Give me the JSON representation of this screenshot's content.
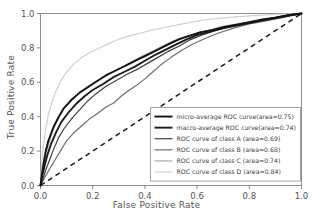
{
  "chart_data": {
    "type": "line",
    "title": "",
    "xlabel": "False Positive Rate",
    "ylabel": "True Positive Rate",
    "xlim": [
      0.0,
      1.0
    ],
    "ylim": [
      0.0,
      1.0
    ],
    "xticks": [
      "0.0",
      "0.2",
      "0.4",
      "0.6",
      "0.8",
      "1.0"
    ],
    "yticks": [
      "0.0",
      "0.2",
      "0.4",
      "0.6",
      "0.8",
      "1.0"
    ],
    "xtick_values": [
      0.0,
      0.2,
      0.4,
      0.6,
      0.8,
      1.0
    ],
    "ytick_values": [
      0.0,
      0.2,
      0.4,
      0.6,
      0.8,
      1.0
    ],
    "grid": false,
    "legend_position": "lower right",
    "chance_line": {
      "label": "chance",
      "style": "dashed",
      "color": "#1a1a1a",
      "x": [
        0.0,
        1.0
      ],
      "y": [
        0.0,
        1.0
      ]
    },
    "series": [
      {
        "name": "micro-average ROC curve(area=0.75)",
        "area": 0.75,
        "color": "#121212",
        "width": 1.9,
        "x": [
          0.0,
          0.005,
          0.012,
          0.02,
          0.03,
          0.05,
          0.07,
          0.09,
          0.12,
          0.15,
          0.18,
          0.21,
          0.25,
          0.29,
          0.33,
          0.37,
          0.41,
          0.45,
          0.49,
          0.53,
          0.57,
          0.61,
          0.66,
          0.7,
          0.75,
          0.8,
          0.85,
          0.9,
          0.95,
          1.0
        ],
        "y": [
          0.0,
          0.06,
          0.13,
          0.2,
          0.26,
          0.34,
          0.4,
          0.45,
          0.5,
          0.54,
          0.57,
          0.6,
          0.64,
          0.67,
          0.7,
          0.73,
          0.76,
          0.79,
          0.82,
          0.85,
          0.87,
          0.89,
          0.905,
          0.92,
          0.935,
          0.95,
          0.965,
          0.975,
          0.99,
          1.0
        ]
      },
      {
        "name": "macro-average ROC curve(area=0.74)",
        "area": 0.74,
        "color": "#1c1c1c",
        "width": 1.9,
        "x": [
          0.0,
          0.006,
          0.015,
          0.025,
          0.04,
          0.06,
          0.08,
          0.11,
          0.14,
          0.17,
          0.2,
          0.24,
          0.28,
          0.32,
          0.36,
          0.4,
          0.44,
          0.48,
          0.52,
          0.56,
          0.6,
          0.65,
          0.7,
          0.75,
          0.8,
          0.85,
          0.9,
          0.95,
          1.0
        ],
        "y": [
          0.0,
          0.05,
          0.11,
          0.17,
          0.24,
          0.31,
          0.37,
          0.43,
          0.48,
          0.52,
          0.555,
          0.59,
          0.63,
          0.66,
          0.69,
          0.725,
          0.76,
          0.79,
          0.82,
          0.85,
          0.875,
          0.895,
          0.915,
          0.93,
          0.945,
          0.96,
          0.975,
          0.99,
          1.0
        ]
      },
      {
        "name": "ROC curve of class A (area=0.69)",
        "area": 0.69,
        "color": "#3f3f3f",
        "width": 1.2,
        "x": [
          0.0,
          0.01,
          0.02,
          0.035,
          0.05,
          0.07,
          0.09,
          0.12,
          0.15,
          0.18,
          0.21,
          0.25,
          0.29,
          0.33,
          0.37,
          0.41,
          0.45,
          0.49,
          0.53,
          0.57,
          0.62,
          0.67,
          0.72,
          0.78,
          0.84,
          0.9,
          0.95,
          1.0
        ],
        "y": [
          0.0,
          0.04,
          0.09,
          0.15,
          0.21,
          0.28,
          0.33,
          0.39,
          0.44,
          0.49,
          0.53,
          0.575,
          0.61,
          0.645,
          0.675,
          0.71,
          0.745,
          0.78,
          0.81,
          0.845,
          0.875,
          0.9,
          0.92,
          0.94,
          0.955,
          0.97,
          0.985,
          1.0
        ]
      },
      {
        "name": "ROC curve of class B (area=0.68)",
        "area": 0.68,
        "color": "#6e6e6e",
        "width": 1.2,
        "x": [
          0.0,
          0.01,
          0.025,
          0.04,
          0.06,
          0.08,
          0.1,
          0.13,
          0.16,
          0.19,
          0.22,
          0.25,
          0.28,
          0.31,
          0.34,
          0.37,
          0.4,
          0.43,
          0.46,
          0.5,
          0.54,
          0.58,
          0.63,
          0.68,
          0.74,
          0.8,
          0.86,
          0.92,
          1.0
        ],
        "y": [
          0.0,
          0.03,
          0.07,
          0.11,
          0.16,
          0.21,
          0.26,
          0.31,
          0.35,
          0.39,
          0.42,
          0.455,
          0.48,
          0.52,
          0.555,
          0.585,
          0.62,
          0.66,
          0.7,
          0.745,
          0.785,
          0.82,
          0.855,
          0.885,
          0.915,
          0.94,
          0.955,
          0.975,
          1.0
        ]
      },
      {
        "name": "ROC curve of class C (area=0.74)",
        "area": 0.74,
        "color": "#a8a8a8",
        "width": 1.2,
        "x": [
          0.0,
          0.005,
          0.012,
          0.022,
          0.035,
          0.05,
          0.07,
          0.09,
          0.12,
          0.15,
          0.18,
          0.22,
          0.26,
          0.3,
          0.34,
          0.38,
          0.42,
          0.46,
          0.5,
          0.55,
          0.6,
          0.65,
          0.7,
          0.76,
          0.82,
          0.88,
          0.94,
          1.0
        ],
        "y": [
          0.0,
          0.05,
          0.12,
          0.19,
          0.26,
          0.33,
          0.4,
          0.45,
          0.5,
          0.54,
          0.575,
          0.61,
          0.645,
          0.675,
          0.71,
          0.745,
          0.775,
          0.805,
          0.835,
          0.865,
          0.885,
          0.905,
          0.925,
          0.94,
          0.955,
          0.97,
          0.985,
          1.0
        ]
      },
      {
        "name": "ROC curve of class D (area=0.84)",
        "area": 0.84,
        "color": "#cfcfcf",
        "width": 1.2,
        "x": [
          0.0,
          0.004,
          0.01,
          0.02,
          0.03,
          0.045,
          0.06,
          0.08,
          0.1,
          0.13,
          0.16,
          0.19,
          0.22,
          0.26,
          0.3,
          0.34,
          0.38,
          0.43,
          0.48,
          0.53,
          0.58,
          0.64,
          0.7,
          0.76,
          0.82,
          0.88,
          0.94,
          1.0
        ],
        "y": [
          0.0,
          0.1,
          0.22,
          0.33,
          0.41,
          0.49,
          0.55,
          0.615,
          0.66,
          0.71,
          0.745,
          0.775,
          0.795,
          0.825,
          0.85,
          0.87,
          0.885,
          0.905,
          0.92,
          0.935,
          0.95,
          0.965,
          0.975,
          0.982,
          0.988,
          0.993,
          0.997,
          1.0
        ]
      }
    ]
  }
}
